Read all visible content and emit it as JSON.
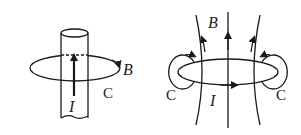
{
  "left_diagram": {
    "description": "Magnetic field B around a straight current-carrying wire",
    "labels": {
      "field": "B",
      "loop": "C",
      "current": "I"
    }
  },
  "right_diagram": {
    "description": "Magnetic field B through a current loop",
    "labels": {
      "field": "B",
      "loop_left": "C",
      "loop_right": "C",
      "current": "I"
    }
  },
  "colors": {
    "stroke": "#1a1a1a",
    "background": "#ffffff"
  }
}
